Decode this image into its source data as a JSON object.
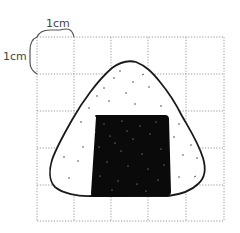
{
  "diagram": {
    "grid": {
      "columns": 5,
      "rows": 5,
      "cell_unit": "1cm",
      "line_style": "dotted",
      "line_color": "#9a9a9a"
    },
    "labels": {
      "horizontal_scale": "1cm",
      "vertical_scale": "1cm"
    },
    "colors": {
      "outline": "#1a1a1a",
      "nori": "#0a0a0a",
      "rice_fill": "#ffffff",
      "background": "#ffffff"
    }
  }
}
